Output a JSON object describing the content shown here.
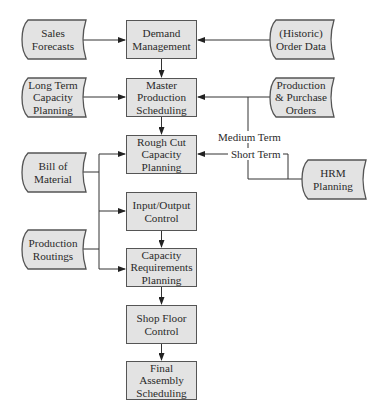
{
  "diagram": {
    "type": "flowchart",
    "process_boxes": [
      {
        "id": "demand",
        "label": "Demand Management",
        "lines": [
          "Demand",
          "Management"
        ],
        "x": 126,
        "y": 20,
        "w": 71,
        "h": 39
      },
      {
        "id": "mps",
        "label": "Master Production Scheduling",
        "lines": [
          "Master",
          "Production",
          "Scheduling"
        ],
        "x": 126,
        "y": 78,
        "w": 71,
        "h": 39
      },
      {
        "id": "rccp",
        "label": "Rough Cut Capacity Planning",
        "lines": [
          "Rough Cut",
          "Capacity",
          "Planning"
        ],
        "x": 126,
        "y": 135,
        "w": 71,
        "h": 39
      },
      {
        "id": "ioc",
        "label": "Input/Output Control",
        "lines": [
          "Input/Output",
          "Control"
        ],
        "x": 126,
        "y": 192,
        "w": 71,
        "h": 39
      },
      {
        "id": "crp",
        "label": "Capacity Requirements Planning",
        "lines": [
          "Capacity",
          "Requirements",
          "Planning"
        ],
        "x": 126,
        "y": 248,
        "w": 71,
        "h": 39
      },
      {
        "id": "sfc",
        "label": "Shop Floor Control",
        "lines": [
          "Shop Floor",
          "Control"
        ],
        "x": 126,
        "y": 305,
        "w": 71,
        "h": 39
      },
      {
        "id": "fas",
        "label": "Final Assembly Scheduling",
        "lines": [
          "Final",
          "Assembly",
          "Scheduling"
        ],
        "x": 126,
        "y": 361,
        "w": 71,
        "h": 39
      }
    ],
    "data_sources": [
      {
        "id": "sales",
        "label": "Sales Forecasts",
        "lines": [
          "Sales",
          "Forecasts"
        ],
        "x": 22,
        "y": 20,
        "w": 64,
        "h": 39
      },
      {
        "id": "ltcp",
        "label": "Long Term Capacity Planning",
        "lines": [
          "Long Term",
          "Capacity",
          "Planning"
        ],
        "x": 22,
        "y": 78,
        "w": 64,
        "h": 39
      },
      {
        "id": "bom",
        "label": "Bill of Material",
        "lines": [
          "Bill of",
          "Material"
        ],
        "x": 22,
        "y": 153,
        "w": 64,
        "h": 39
      },
      {
        "id": "routings",
        "label": "Production Routings",
        "lines": [
          "Production",
          "Routings"
        ],
        "x": 22,
        "y": 230,
        "w": 64,
        "h": 39
      },
      {
        "id": "historic",
        "label": "(Historic) Order Data",
        "lines": [
          "(Historic)",
          "Order Data"
        ],
        "x": 270,
        "y": 20,
        "w": 64,
        "h": 39
      },
      {
        "id": "ppo",
        "label": "Production & Purchase Orders",
        "lines": [
          "Production",
          "& Purchase",
          "Orders"
        ],
        "x": 270,
        "y": 78,
        "w": 64,
        "h": 39
      },
      {
        "id": "hrm",
        "label": "HRM Planning",
        "lines": [
          "HRM",
          "Planning"
        ],
        "x": 302,
        "y": 160,
        "w": 64,
        "h": 39
      }
    ],
    "edge_labels": {
      "medium_term": "Medium Term",
      "short_term": "Short Term"
    },
    "edges": [
      {
        "from": "Sales Forecasts",
        "to": "Demand Management"
      },
      {
        "from": "(Historic) Order Data",
        "to": "Demand Management"
      },
      {
        "from": "Demand Management",
        "to": "Master Production Scheduling"
      },
      {
        "from": "Long Term Capacity Planning",
        "to": "Master Production Scheduling"
      },
      {
        "from": "Production & Purchase Orders",
        "to": "Master Production Scheduling"
      },
      {
        "from": "HRM Planning",
        "to": "Master Production Scheduling",
        "label": "Medium Term"
      },
      {
        "from": "HRM Planning",
        "to": "Rough Cut Capacity Planning",
        "label": "Short Term"
      },
      {
        "from": "Master Production Scheduling",
        "to": "Rough Cut Capacity Planning"
      },
      {
        "from": "Bill of Material",
        "to": "Rough Cut Capacity Planning"
      },
      {
        "from": "Bill of Material",
        "to": "Input/Output Control"
      },
      {
        "from": "Production Routings",
        "to": "Capacity Requirements Planning"
      },
      {
        "from": "Input/Output Control",
        "to": "Capacity Requirements Planning"
      },
      {
        "from": "Capacity Requirements Planning",
        "to": "Shop Floor Control"
      },
      {
        "from": "Shop Floor Control",
        "to": "Final Assembly Scheduling"
      }
    ],
    "colors": {
      "box_fill": "#e3e3e3",
      "stroke": "#555555",
      "line": "#333333",
      "text": "#2a2a2a"
    }
  }
}
